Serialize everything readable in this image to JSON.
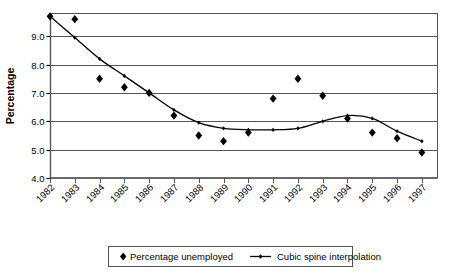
{
  "chart_data": {
    "type": "scatter",
    "title": "",
    "xlabel": "",
    "ylabel": "Percentage",
    "xlim": [
      1981.5,
      1997.8
    ],
    "ylim": [
      4.0,
      9.8
    ],
    "grid": true,
    "legend_position": "bottom",
    "categories": [
      "1982",
      "1983",
      "1984",
      "1985",
      "1986",
      "1987",
      "1988",
      "1989",
      "1990",
      "1991",
      "1992",
      "1993",
      "1994",
      "1995",
      "1996",
      "1997"
    ],
    "x_tick_labels": [
      "1982",
      "1983",
      "1984",
      "1985",
      "1986",
      "1987",
      "1988",
      "1989",
      "1990",
      "1991",
      "1992",
      "1993",
      "1994",
      "1995",
      "1996",
      "1997"
    ],
    "y_tick_labels": [
      "4.0",
      "5.0",
      "6.0",
      "7.0",
      "8.0",
      "9.0"
    ],
    "y_ticks": [
      4.0,
      5.0,
      6.0,
      7.0,
      8.0,
      9.0
    ],
    "series": [
      {
        "name": "Percentage unemployed",
        "marker": "diamond",
        "type": "scatter",
        "color": "#000000",
        "x": [
          1982,
          1983,
          1984,
          1985,
          1986,
          1987,
          1988,
          1989,
          1990,
          1991,
          1992,
          1993,
          1994,
          1995,
          1996,
          1997
        ],
        "values": [
          9.7,
          9.6,
          7.5,
          7.2,
          7.0,
          6.2,
          5.5,
          5.3,
          5.6,
          6.8,
          7.5,
          6.9,
          6.1,
          5.6,
          5.4,
          4.9
        ]
      },
      {
        "name": "Cubic spine interpolation",
        "marker": "line",
        "type": "line",
        "color": "#000000",
        "x": [
          1982,
          1983,
          1984,
          1985,
          1986,
          1987,
          1988,
          1989,
          1990,
          1991,
          1992,
          1993,
          1994,
          1995,
          1996,
          1997
        ],
        "values": [
          9.7,
          8.95,
          8.2,
          7.6,
          7.0,
          6.4,
          5.95,
          5.75,
          5.7,
          5.7,
          5.75,
          6.0,
          6.2,
          6.1,
          5.65,
          5.3
        ]
      }
    ],
    "legend": [
      {
        "label": "Percentage unemployed",
        "marker": "diamond"
      },
      {
        "label": "Cubic spine interpolation",
        "marker": "line"
      }
    ]
  },
  "colors": {
    "axis": "#000000",
    "grid": "#555555",
    "plot_border": "#555555",
    "marker": "#000000",
    "curve": "#000000",
    "background": "#ffffff"
  }
}
